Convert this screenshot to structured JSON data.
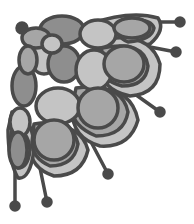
{
  "image": {
    "description": "Grayscale decorative corner floral ornament with overlapping scale-like petals and stamens ending in round dots",
    "colors": {
      "background": "#ffffff",
      "outline": "#4a4a4a",
      "petal_dark": "#8e8e8e",
      "petal_mid": "#a6a6a6",
      "petal_light": "#c4c4c4",
      "stamen_dot": "#4a4a4a"
    },
    "stamen_count": 6
  }
}
